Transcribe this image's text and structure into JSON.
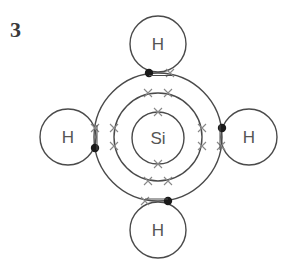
{
  "question_number": "3",
  "diagram": {
    "central_atom": {
      "label": "Si",
      "cx": 158,
      "cy": 138,
      "r": 26
    },
    "shells": [
      {
        "name": "inner-shell",
        "r": 26,
        "electrons": 2
      },
      {
        "name": "middle-shell",
        "r": 44,
        "electrons": 8
      },
      {
        "name": "outer-shell",
        "r": 64,
        "electrons": 4
      }
    ],
    "hydrogens": [
      {
        "name": "h-top",
        "label": "H",
        "cx": 158,
        "cy": 44,
        "r": 28
      },
      {
        "name": "h-left",
        "label": "H",
        "cx": 68,
        "cy": 137,
        "r": 28
      },
      {
        "name": "h-right",
        "label": "H",
        "cx": 249,
        "cy": 137,
        "r": 28
      },
      {
        "name": "h-bottom",
        "label": "H",
        "cx": 158,
        "cy": 230,
        "r": 28
      }
    ],
    "legend": {
      "cross": "silicon electron",
      "dot": "hydrogen electron"
    },
    "colors": {
      "line": "#4a4a4a",
      "cross": "#888888",
      "dot": "#1a1a1a",
      "label": "#555555"
    }
  }
}
